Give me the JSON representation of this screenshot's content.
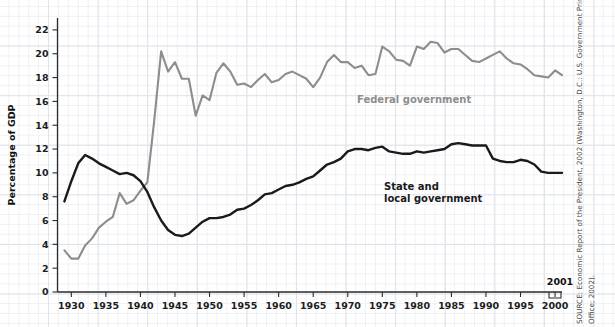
{
  "chart_data": {
    "type": "line",
    "title": "",
    "xlabel": "",
    "ylabel": "Percentage of GDP",
    "xlim": [
      1928,
      2001
    ],
    "ylim": [
      0,
      23
    ],
    "yticks": [
      0,
      2,
      4,
      6,
      8,
      10,
      12,
      14,
      16,
      18,
      20,
      22
    ],
    "xticks": [
      1930,
      1935,
      1940,
      1945,
      1950,
      1955,
      1960,
      1965,
      1970,
      1975,
      1980,
      1985,
      1990,
      1995,
      2000
    ],
    "grid": true,
    "legend_position": "inline-annotations",
    "x": [
      1929,
      1930,
      1931,
      1932,
      1933,
      1934,
      1935,
      1936,
      1937,
      1938,
      1939,
      1940,
      1941,
      1942,
      1943,
      1944,
      1945,
      1946,
      1947,
      1948,
      1949,
      1950,
      1951,
      1952,
      1953,
      1954,
      1955,
      1956,
      1957,
      1958,
      1959,
      1960,
      1961,
      1962,
      1963,
      1964,
      1965,
      1966,
      1967,
      1968,
      1969,
      1970,
      1971,
      1972,
      1973,
      1974,
      1975,
      1976,
      1977,
      1978,
      1979,
      1980,
      1981,
      1982,
      1983,
      1984,
      1985,
      1986,
      1987,
      1988,
      1989,
      1990,
      1991,
      1992,
      1993,
      1994,
      1995,
      1996,
      1997,
      1998,
      1999,
      2000,
      2001
    ],
    "series": [
      {
        "name": "Federal government",
        "color": "#8d8d8d",
        "values": [
          3.5,
          2.8,
          2.8,
          3.9,
          4.5,
          5.4,
          5.9,
          6.3,
          8.3,
          7.4,
          7.7,
          8.5,
          9.2,
          14.4,
          20.2,
          18.5,
          19.3,
          17.9,
          17.9,
          14.8,
          16.5,
          16.1,
          18.4,
          19.2,
          18.5,
          17.4,
          17.5,
          17.2,
          17.8,
          18.3,
          17.6,
          17.8,
          18.3,
          18.5,
          18.2,
          17.9,
          17.2,
          18.0,
          19.3,
          19.9,
          19.3,
          19.3,
          18.8,
          19.0,
          18.2,
          18.3,
          20.6,
          20.2,
          19.5,
          19.4,
          19.0,
          20.6,
          20.4,
          21.0,
          20.9,
          20.1,
          20.4,
          20.4,
          19.9,
          19.4,
          19.3,
          19.6,
          19.9,
          20.2,
          19.6,
          19.2,
          19.1,
          18.7,
          18.2,
          18.1,
          18.0,
          18.6,
          18.2
        ]
      },
      {
        "name": "State and local government",
        "color": "#1a1a1a",
        "values": [
          7.6,
          9.3,
          10.8,
          11.5,
          11.2,
          10.8,
          10.5,
          10.2,
          9.9,
          10.0,
          9.8,
          9.3,
          8.4,
          7.1,
          6.0,
          5.2,
          4.8,
          4.7,
          4.9,
          5.4,
          5.9,
          6.2,
          6.2,
          6.3,
          6.5,
          6.9,
          7.0,
          7.3,
          7.7,
          8.2,
          8.3,
          8.6,
          8.9,
          9.0,
          9.2,
          9.5,
          9.7,
          10.2,
          10.7,
          10.9,
          11.2,
          11.8,
          12.0,
          12.0,
          11.9,
          12.1,
          12.2,
          11.8,
          11.7,
          11.6,
          11.6,
          11.8,
          11.7,
          11.8,
          11.9,
          12.0,
          12.4,
          12.5,
          12.4,
          12.3,
          12.3,
          12.3,
          11.2,
          11.0,
          10.9,
          10.9,
          11.1,
          11.0,
          10.7,
          10.1,
          10.0,
          10.0,
          10.0
        ]
      }
    ],
    "annotations": [
      {
        "name": "federal-label",
        "text": "Federal government",
        "x": 1963,
        "y": 16.0
      },
      {
        "name": "state-label-line1",
        "text": "State and",
        "x": 1971,
        "y": 10.5
      },
      {
        "name": "state-label-line2",
        "text": "local government",
        "x": 1971,
        "y": 9.6
      },
      {
        "name": "endpoint-year",
        "text": "2001",
        "x": 2001,
        "y": 1.4
      }
    ]
  },
  "axis": {
    "y_title": "Percentage of GDP",
    "y_tick_labels": [
      "0",
      "2",
      "4",
      "6",
      "8",
      "10",
      "12",
      "14",
      "16",
      "18",
      "20",
      "22"
    ],
    "x_tick_labels": [
      "1930",
      "1935",
      "1940",
      "1945",
      "1950",
      "1955",
      "1960",
      "1965",
      "1970",
      "1975",
      "1980",
      "1985",
      "1990",
      "1995",
      "2000"
    ]
  },
  "labels": {
    "federal": "Federal government",
    "state_line1": "State and",
    "state_line2": "local government",
    "endpoint_year": "2001"
  },
  "source": {
    "line1": "SOURCE: Economic Report of the President, 2002 (Washington, D.C.: U.S. Government Printing",
    "line2": "Office; 2002)."
  },
  "colors": {
    "federal_line": "#8d8d8d",
    "state_line": "#1a1a1a",
    "grid_minor": "#eef1f4",
    "grid_major": "#dfe4ea",
    "axis": "#2b2b2b",
    "background": "#ffffff"
  }
}
